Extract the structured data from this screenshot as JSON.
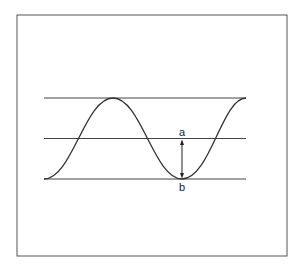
{
  "diagram": {
    "type": "wave-amplitude",
    "labels": {
      "a": "a",
      "b": "b"
    },
    "colors": {
      "line": "#333333",
      "frame": "#444444",
      "background": "#ffffff"
    }
  }
}
